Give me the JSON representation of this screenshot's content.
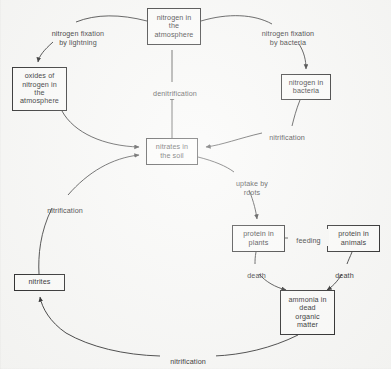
{
  "diagram": {
    "background_color": "#f7f7f5",
    "line_color": "#1a1a1a",
    "text_color": "#101010",
    "nodes": [
      {
        "id": "nitrogen-atmosphere",
        "label": "nitrogen in\nthe\natmosphere",
        "x": 147,
        "y": 8,
        "w": 54,
        "h": 37
      },
      {
        "id": "oxides-nitrogen-atmosphere",
        "label": "oxides of\nnitrogen in\nthe\natmosphere",
        "x": 12,
        "y": 67,
        "w": 55,
        "h": 44
      },
      {
        "id": "nitrogen-bacteria",
        "label": "nitrogen in\nbacteria",
        "x": 281,
        "y": 74,
        "w": 50,
        "h": 26
      },
      {
        "id": "nitrates-soil",
        "label": "nitrates in\nthe soil",
        "x": 146,
        "y": 138,
        "w": 52,
        "h": 27
      },
      {
        "id": "protein-plants",
        "label": "protein in\nplants",
        "x": 232,
        "y": 225,
        "w": 53,
        "h": 27
      },
      {
        "id": "protein-animals",
        "label": "protein in\nanimals",
        "x": 327,
        "y": 225,
        "w": 53,
        "h": 27
      },
      {
        "id": "ammonia-dead-organic-matter",
        "label": "ammonia in\ndead\norganic\nmatter",
        "x": 280,
        "y": 290,
        "w": 55,
        "h": 45
      },
      {
        "id": "nitrites",
        "label": "nitrites",
        "x": 14,
        "y": 274,
        "w": 51,
        "h": 17
      }
    ],
    "edge_labels": [
      {
        "id": "nitrogen-fixation-by-lightning",
        "label": "nitrogen fixation\nby lightning",
        "x": 33,
        "y": 22,
        "w": 90
      },
      {
        "id": "nitrogen-fixation-by-bacteria",
        "label": "nitrogen fixation\nby bacteria",
        "x": 242,
        "y": 22,
        "w": 92
      },
      {
        "id": "denitrification",
        "label": "denitrification",
        "x": 142,
        "y": 82,
        "w": 62
      },
      {
        "id": "nitrification-bacteria-to-nitrates",
        "label": "nitrification",
        "x": 262,
        "y": 126,
        "w": 50
      },
      {
        "id": "uptake-by-roots",
        "label": "uptake by\nroots",
        "x": 228,
        "y": 172,
        "w": 48
      },
      {
        "id": "feeding",
        "label": "feeding",
        "x": 288,
        "y": 229,
        "w": 37
      },
      {
        "id": "death-plants",
        "label": "death",
        "x": 242,
        "y": 264,
        "w": 29
      },
      {
        "id": "death-animals",
        "label": "death",
        "x": 330,
        "y": 264,
        "w": 29
      },
      {
        "id": "nitrification-nitrites-to-nitrates",
        "label": "nitrification",
        "x": 40,
        "y": 199,
        "w": 50
      },
      {
        "id": "nitrification-ammonia-to-nitrites",
        "label": "nitrification",
        "x": 160,
        "y": 350,
        "w": 52
      }
    ],
    "edges": [
      {
        "id": "atmosphere-to-lightning-oxides",
        "from": "nitrogen-atmosphere",
        "to": "oxides-nitrogen-atmosphere",
        "label": "nitrogen fixation by lightning"
      },
      {
        "id": "atmosphere-to-bacteria",
        "from": "nitrogen-atmosphere",
        "to": "nitrogen-bacteria",
        "label": "nitrogen fixation by bacteria"
      },
      {
        "id": "nitrates-to-atmosphere",
        "from": "nitrates-soil",
        "to": "nitrogen-atmosphere",
        "label": "denitrification"
      },
      {
        "id": "oxides-to-nitrates",
        "from": "oxides-nitrogen-atmosphere",
        "to": "nitrates-soil",
        "label": ""
      },
      {
        "id": "bacteria-to-nitrates",
        "from": "nitrogen-bacteria",
        "to": "nitrates-soil",
        "label": "nitrification"
      },
      {
        "id": "nitrates-to-plants",
        "from": "nitrates-soil",
        "to": "protein-plants",
        "label": "uptake by roots"
      },
      {
        "id": "plants-to-animals",
        "from": "protein-plants",
        "to": "protein-animals",
        "label": "feeding"
      },
      {
        "id": "plants-to-ammonia",
        "from": "protein-plants",
        "to": "ammonia-dead-organic-matter",
        "label": "death"
      },
      {
        "id": "animals-to-ammonia",
        "from": "protein-animals",
        "to": "ammonia-dead-organic-matter",
        "label": "death"
      },
      {
        "id": "ammonia-to-nitrites",
        "from": "ammonia-dead-organic-matter",
        "to": "nitrites",
        "label": "nitrification"
      },
      {
        "id": "nitrites-to-nitrates",
        "from": "nitrites",
        "to": "nitrates-soil",
        "label": "nitrification"
      }
    ]
  }
}
